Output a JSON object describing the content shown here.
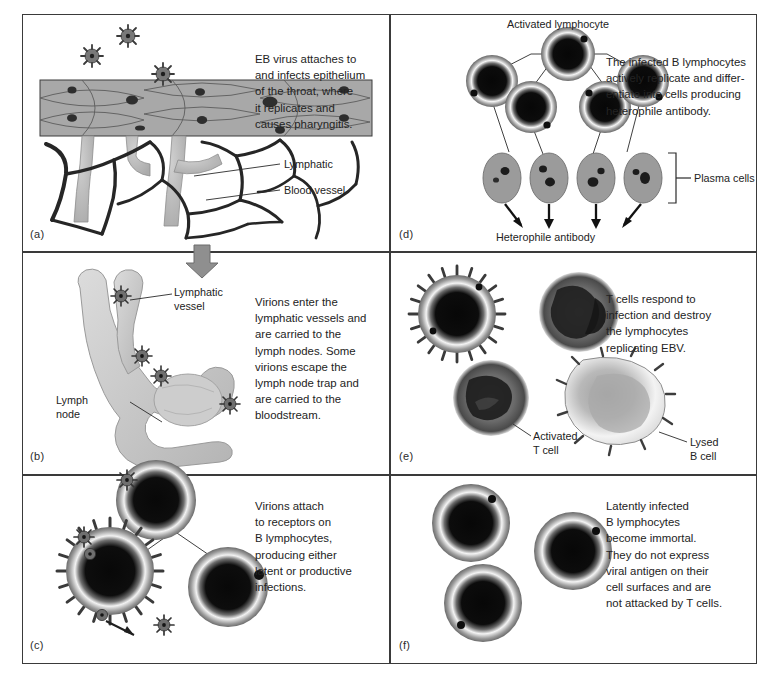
{
  "figure": {
    "panels": [
      {
        "id": "a",
        "label": "(a)",
        "caption": "EB virus attaches to\nand infects epithelium\nof the throat, where\nit replicates and\ncauses pharyngitis.",
        "annotations": [
          {
            "name": "lymphatic",
            "text": "Lymphatic"
          },
          {
            "name": "blood-vessel",
            "text": "Blood vessel"
          }
        ]
      },
      {
        "id": "b",
        "label": "(b)",
        "caption": "Virions enter the\nlymphatic vessels and\nare carried to the\nlymph nodes. Some\nvirions escape the\nlymph node trap and\nare carried to the\nbloodstream.",
        "annotations": [
          {
            "name": "lymphatic-vessel",
            "text": "Lymphatic\nvessel"
          },
          {
            "name": "lymph-node",
            "text": "Lymph\nnode"
          }
        ]
      },
      {
        "id": "c",
        "label": "(c)",
        "caption": "Virions attach\nto receptors on\nB lymphocytes,\nproducing either\nlatent or productive\ninfections.",
        "annotations": []
      },
      {
        "id": "d",
        "label": "(d)",
        "caption": "The infected B lymphocytes\nactively replicate and differ-\nentiate into cells producing\nheterophile antibody.",
        "annotations": [
          {
            "name": "activated-lymphocyte",
            "text": "Activated lymphocyte"
          },
          {
            "name": "plasma-cells",
            "text": "Plasma cells"
          },
          {
            "name": "heterophile-antibody",
            "text": "Heterophile antibody"
          }
        ]
      },
      {
        "id": "e",
        "label": "(e)",
        "caption": "T cells respond to\ninfection and destroy\nthe lymphocytes\nreplicating EBV.",
        "annotations": [
          {
            "name": "activated-t-cell",
            "text": "Activated\nT cell"
          },
          {
            "name": "lysed-b-cell",
            "text": "Lysed\nB cell"
          }
        ]
      },
      {
        "id": "f",
        "label": "(f)",
        "caption": "Latently infected\nB lymphocytes\nbecome immortal.\nThey do not express\nviral antigen on their\ncell surfaces and are\nnot attacked by T cells.",
        "annotations": []
      }
    ],
    "colors": {
      "border": "#3a3a3a",
      "epithelium": "#a6a6a6",
      "nucleus": "#2b2b2b",
      "vessel": "#b8b8b8",
      "blood": "#2a2a2a",
      "virion": "#6e6e6e",
      "plasma_cell": "#9a9a9a",
      "lymph_node": "#cfcfcf",
      "arrow": "#8f8f8f",
      "text": "#232323"
    }
  }
}
